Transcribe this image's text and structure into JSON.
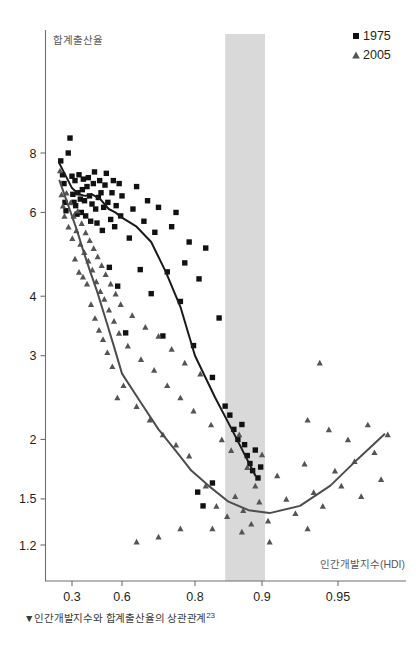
{
  "chart_data": {
    "type": "scatter",
    "title": "",
    "subtitle": "",
    "caption": "▼인간개발지수와 합계출산율의 상관관계",
    "caption_note": "23",
    "xlabel": "인간개발지수(HDI)",
    "ylabel": "합계출산율",
    "x_scale": "log-like",
    "y_scale": "log",
    "xlim": [
      0.22,
      0.985
    ],
    "ylim": [
      1.1,
      9.2
    ],
    "grid": false,
    "legend_position": "top-right",
    "xticks": [
      0.3,
      0.6,
      0.8,
      0.9,
      0.95
    ],
    "xtick_labels": [
      "0.3",
      "0.6",
      "0.8",
      "0.9",
      "0.95"
    ],
    "yticks": [
      8,
      6,
      4,
      3,
      2,
      1.5,
      1.2
    ],
    "ytick_labels": [
      "8",
      "6",
      "4",
      "3",
      "2",
      "1.5",
      "1.2"
    ],
    "highlight_band": {
      "x0": 0.845,
      "x1": 0.902,
      "color": "#d9d9d9",
      "label": ""
    },
    "series": [
      {
        "name": "1975",
        "marker": "square",
        "color": "#111111",
        "points": [
          [
            0.255,
            7.7
          ],
          [
            0.262,
            7.2
          ],
          [
            0.268,
            6.9
          ],
          [
            0.272,
            6.3
          ],
          [
            0.276,
            6.05
          ],
          [
            0.285,
            8.0
          ],
          [
            0.292,
            8.6
          ],
          [
            0.3,
            7.15
          ],
          [
            0.305,
            6.55
          ],
          [
            0.312,
            6.3
          ],
          [
            0.318,
            7.0
          ],
          [
            0.322,
            6.2
          ],
          [
            0.33,
            5.95
          ],
          [
            0.335,
            6.6
          ],
          [
            0.342,
            7.2
          ],
          [
            0.35,
            6.4
          ],
          [
            0.356,
            6.0
          ],
          [
            0.362,
            6.7
          ],
          [
            0.368,
            7.05
          ],
          [
            0.375,
            6.35
          ],
          [
            0.382,
            5.9
          ],
          [
            0.39,
            6.8
          ],
          [
            0.398,
            7.1
          ],
          [
            0.405,
            6.5
          ],
          [
            0.412,
            5.75
          ],
          [
            0.42,
            6.25
          ],
          [
            0.428,
            6.9
          ],
          [
            0.435,
            7.3
          ],
          [
            0.442,
            6.1
          ],
          [
            0.45,
            5.7
          ],
          [
            0.458,
            6.45
          ],
          [
            0.466,
            7.0
          ],
          [
            0.474,
            6.6
          ],
          [
            0.482,
            5.5
          ],
          [
            0.49,
            6.15
          ],
          [
            0.498,
            6.85
          ],
          [
            0.506,
            7.25
          ],
          [
            0.515,
            6.3
          ],
          [
            0.524,
            4.6
          ],
          [
            0.532,
            5.8
          ],
          [
            0.54,
            6.6
          ],
          [
            0.548,
            7.0
          ],
          [
            0.556,
            5.6
          ],
          [
            0.565,
            6.2
          ],
          [
            0.574,
            4.2
          ],
          [
            0.583,
            6.9
          ],
          [
            0.592,
            5.9
          ],
          [
            0.6,
            6.5
          ],
          [
            0.61,
            3.35
          ],
          [
            0.62,
            5.3
          ],
          [
            0.63,
            6.1
          ],
          [
            0.64,
            6.8
          ],
          [
            0.65,
            4.55
          ],
          [
            0.66,
            5.75
          ],
          [
            0.67,
            6.35
          ],
          [
            0.68,
            4.05
          ],
          [
            0.69,
            5.45
          ],
          [
            0.7,
            6.15
          ],
          [
            0.712,
            3.3
          ],
          [
            0.724,
            4.5
          ],
          [
            0.736,
            5.6
          ],
          [
            0.748,
            6.0
          ],
          [
            0.76,
            3.9
          ],
          [
            0.772,
            4.7
          ],
          [
            0.784,
            5.2
          ],
          [
            0.796,
            3.15
          ],
          [
            0.806,
            4.35
          ],
          [
            0.816,
            5.05
          ],
          [
            0.826,
            2.7
          ],
          [
            0.836,
            3.6
          ],
          [
            0.845,
            2.35
          ],
          [
            0.852,
            2.25
          ],
          [
            0.858,
            2.1
          ],
          [
            0.864,
            2.0
          ],
          [
            0.87,
            2.15
          ],
          [
            0.874,
            1.95
          ],
          [
            0.878,
            1.85
          ],
          [
            0.882,
            1.78
          ],
          [
            0.886,
            1.72
          ],
          [
            0.89,
            1.9
          ],
          [
            0.894,
            1.66
          ],
          [
            0.898,
            1.75
          ],
          [
            0.826,
            1.62
          ],
          [
            0.812,
            1.45
          ],
          [
            0.804,
            1.55
          ]
        ]
      },
      {
        "name": "2005",
        "marker": "triangle",
        "color": "#545454",
        "points": [
          [
            0.252,
            7.35
          ],
          [
            0.258,
            6.55
          ],
          [
            0.264,
            6.2
          ],
          [
            0.27,
            5.9
          ],
          [
            0.278,
            6.6
          ],
          [
            0.286,
            5.6
          ],
          [
            0.294,
            6.3
          ],
          [
            0.302,
            5.3
          ],
          [
            0.31,
            5.9
          ],
          [
            0.318,
            4.8
          ],
          [
            0.326,
            5.5
          ],
          [
            0.334,
            6.05
          ],
          [
            0.342,
            4.5
          ],
          [
            0.35,
            5.15
          ],
          [
            0.358,
            5.7
          ],
          [
            0.366,
            4.4
          ],
          [
            0.374,
            4.95
          ],
          [
            0.382,
            5.45
          ],
          [
            0.39,
            4.25
          ],
          [
            0.398,
            4.75
          ],
          [
            0.406,
            5.25
          ],
          [
            0.414,
            3.85
          ],
          [
            0.422,
            4.55
          ],
          [
            0.43,
            5.05
          ],
          [
            0.438,
            3.6
          ],
          [
            0.446,
            4.3
          ],
          [
            0.454,
            4.85
          ],
          [
            0.462,
            3.4
          ],
          [
            0.47,
            4.1
          ],
          [
            0.478,
            4.65
          ],
          [
            0.486,
            3.25
          ],
          [
            0.494,
            3.95
          ],
          [
            0.502,
            4.45
          ],
          [
            0.512,
            3.05
          ],
          [
            0.522,
            3.75
          ],
          [
            0.532,
            4.25
          ],
          [
            0.542,
            2.85
          ],
          [
            0.552,
            3.55
          ],
          [
            0.562,
            4.05
          ],
          [
            0.572,
            2.45
          ],
          [
            0.582,
            3.35
          ],
          [
            0.592,
            3.85
          ],
          [
            0.604,
            2.6
          ],
          [
            0.616,
            3.15
          ],
          [
            0.628,
            3.65
          ],
          [
            0.64,
            2.35
          ],
          [
            0.652,
            2.95
          ],
          [
            0.664,
            3.45
          ],
          [
            0.676,
            2.2
          ],
          [
            0.688,
            2.8
          ],
          [
            0.7,
            3.3
          ],
          [
            0.712,
            2.05
          ],
          [
            0.724,
            2.6
          ],
          [
            0.736,
            3.1
          ],
          [
            0.748,
            1.95
          ],
          [
            0.76,
            2.45
          ],
          [
            0.772,
            2.9
          ],
          [
            0.784,
            1.85
          ],
          [
            0.796,
            2.3
          ],
          [
            0.808,
            2.75
          ],
          [
            0.816,
            1.6
          ],
          [
            0.824,
            2.15
          ],
          [
            0.832,
            1.45
          ],
          [
            0.84,
            2.0
          ],
          [
            0.848,
            1.38
          ],
          [
            0.854,
            1.9
          ],
          [
            0.86,
            1.52
          ],
          [
            0.866,
            2.05
          ],
          [
            0.872,
            1.42
          ],
          [
            0.878,
            1.75
          ],
          [
            0.884,
            1.33
          ],
          [
            0.89,
            1.6
          ],
          [
            0.896,
            1.48
          ],
          [
            0.9,
            1.86
          ],
          [
            0.904,
            1.35
          ],
          [
            0.91,
            1.68
          ],
          [
            0.916,
            1.5
          ],
          [
            0.922,
            1.4
          ],
          [
            0.928,
            1.78
          ],
          [
            0.934,
            1.55
          ],
          [
            0.94,
            1.45
          ],
          [
            0.944,
            2.1
          ],
          [
            0.948,
            1.72
          ],
          [
            0.952,
            1.6
          ],
          [
            0.956,
            2.0
          ],
          [
            0.96,
            1.8
          ],
          [
            0.964,
            1.52
          ],
          [
            0.968,
            2.15
          ],
          [
            0.972,
            1.88
          ],
          [
            0.976,
            1.65
          ],
          [
            0.98,
            2.05
          ],
          [
            0.938,
            2.9
          ],
          [
            0.93,
            2.2
          ],
          [
            0.76,
            1.3
          ],
          [
            0.7,
            1.25
          ],
          [
            0.64,
            1.22
          ],
          [
            0.826,
            1.3
          ],
          [
            0.87,
            1.28
          ],
          [
            0.905,
            1.22
          ],
          [
            0.93,
            1.3
          ]
        ]
      }
    ],
    "trend_lines": [
      {
        "name": "1975",
        "color": "#1a1a1a",
        "points": [
          [
            0.25,
            7.6
          ],
          [
            0.3,
            6.75
          ],
          [
            0.34,
            6.55
          ],
          [
            0.38,
            6.5
          ],
          [
            0.42,
            6.55
          ],
          [
            0.47,
            6.4
          ],
          [
            0.52,
            6.1
          ],
          [
            0.56,
            6.0
          ],
          [
            0.6,
            5.85
          ],
          [
            0.64,
            5.6
          ],
          [
            0.68,
            5.2
          ],
          [
            0.72,
            4.5
          ],
          [
            0.76,
            3.8
          ],
          [
            0.8,
            3.0
          ],
          [
            0.83,
            2.45
          ],
          [
            0.855,
            2.1
          ],
          [
            0.875,
            1.85
          ],
          [
            0.89,
            1.68
          ]
        ]
      },
      {
        "name": "2005",
        "color": "#4d4d4d",
        "points": [
          [
            0.25,
            7.0
          ],
          [
            0.29,
            6.1
          ],
          [
            0.33,
            5.5
          ],
          [
            0.37,
            4.95
          ],
          [
            0.41,
            4.5
          ],
          [
            0.45,
            4.1
          ],
          [
            0.5,
            3.6
          ],
          [
            0.55,
            3.15
          ],
          [
            0.6,
            2.75
          ],
          [
            0.65,
            2.4
          ],
          [
            0.7,
            2.1
          ],
          [
            0.75,
            1.88
          ],
          [
            0.79,
            1.72
          ],
          [
            0.82,
            1.6
          ],
          [
            0.85,
            1.48
          ],
          [
            0.88,
            1.42
          ],
          [
            0.905,
            1.4
          ],
          [
            0.925,
            1.45
          ],
          [
            0.945,
            1.6
          ],
          [
            0.962,
            1.82
          ],
          [
            0.978,
            2.05
          ]
        ]
      }
    ],
    "legend": [
      {
        "label": "1975",
        "marker": "square",
        "color": "#111111"
      },
      {
        "label": "2005",
        "marker": "triangle",
        "color": "#545454"
      }
    ]
  }
}
